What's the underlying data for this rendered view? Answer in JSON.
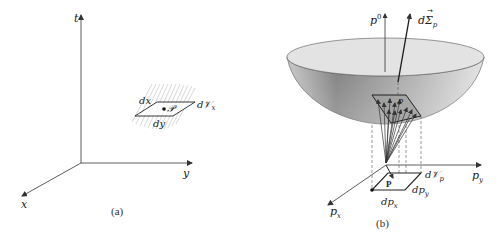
{
  "panel_a": {
    "caption": "(a)",
    "axes": {
      "t": "t",
      "y": "y",
      "x": "x"
    },
    "element": {
      "dx": "dx",
      "dy": "dy",
      "point": "𝒫",
      "volume": "d𝒱",
      "volume_sub": "x"
    }
  },
  "panel_b": {
    "caption": "(b)",
    "axes": {
      "p0": "p",
      "p0_sup": "0",
      "py": "p",
      "py_sub": "y",
      "px": "p",
      "px_sub": "x"
    },
    "surface_vector": {
      "label": "dΣ",
      "sub": "p",
      "arrow": "→"
    },
    "element": {
      "dpx": "dp",
      "dpx_sub": "x",
      "dpy": "dp",
      "dpy_sub": "y",
      "point": "P",
      "volume": "d𝒱",
      "volume_sub": "p",
      "vector": "p",
      "vector_arrow": "→"
    },
    "colors": {
      "paraboloid_light": "#e8e8e8",
      "paraboloid_dark": "#8a8a8a",
      "rim": "#d5d5d5"
    }
  }
}
